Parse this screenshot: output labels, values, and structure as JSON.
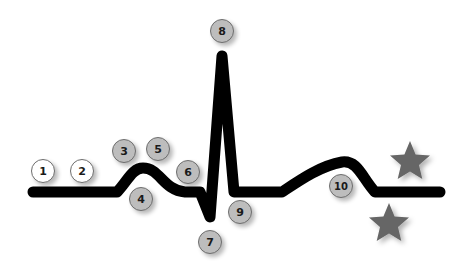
{
  "diagram": {
    "type": "ECG waveform (PQRST complex) with numbered markers",
    "line_color": "#000000",
    "markers": [
      {
        "label": "1",
        "x": 43,
        "y": 171,
        "d": 24,
        "style": "white"
      },
      {
        "label": "2",
        "x": 82,
        "y": 171,
        "d": 24,
        "style": "white"
      },
      {
        "label": "3",
        "x": 124,
        "y": 151,
        "d": 24,
        "style": "gray"
      },
      {
        "label": "4",
        "x": 141,
        "y": 199,
        "d": 24,
        "style": "gray"
      },
      {
        "label": "5",
        "x": 158,
        "y": 149,
        "d": 24,
        "style": "gray"
      },
      {
        "label": "6",
        "x": 188,
        "y": 172,
        "d": 24,
        "style": "gray"
      },
      {
        "label": "7",
        "x": 210,
        "y": 242,
        "d": 24,
        "style": "gray"
      },
      {
        "label": "8",
        "x": 222,
        "y": 31,
        "d": 24,
        "style": "gray"
      },
      {
        "label": "9",
        "x": 240,
        "y": 212,
        "d": 24,
        "style": "gray"
      },
      {
        "label": "10",
        "x": 341,
        "y": 186,
        "d": 24,
        "style": "gray"
      }
    ],
    "stars": [
      {
        "name": "star-upper",
        "x": 410,
        "y": 162,
        "r": 21,
        "color": "#666666"
      },
      {
        "name": "star-lower",
        "x": 389,
        "y": 224,
        "r": 21,
        "color": "#666666"
      }
    ]
  }
}
